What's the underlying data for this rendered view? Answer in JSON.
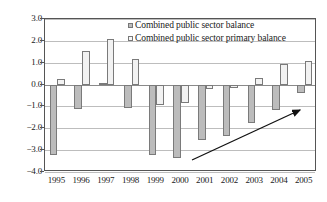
{
  "chart_data": {
    "type": "bar",
    "title": "",
    "xlabel": "",
    "ylabel": "",
    "ylim": [
      -4.0,
      3.0
    ],
    "yticks": [
      "3.0",
      "2.0",
      "1.0",
      "0.0",
      "−1.0",
      "−2.0",
      "−3.0",
      "−4.0"
    ],
    "ytick_values": [
      3.0,
      2.0,
      1.0,
      0.0,
      -1.0,
      -2.0,
      -3.0,
      -4.0
    ],
    "grid": true,
    "legend_position": "top-center",
    "categories": [
      "1995",
      "1996",
      "1997",
      "1998",
      "1999",
      "2000",
      "2001",
      "2002",
      "2003",
      "2004",
      "2005"
    ],
    "series": [
      {
        "name": "Combined public sector balance",
        "color": "#bcbcbc",
        "values": [
          -3.2,
          -1.1,
          0.05,
          -1.05,
          -3.2,
          -3.35,
          -2.55,
          -2.35,
          -1.75,
          -1.15,
          -0.4
        ]
      },
      {
        "name": "Combined public sector primary balance",
        "color": "#f2f2f2",
        "values": [
          0.25,
          1.55,
          2.1,
          1.15,
          -0.95,
          -0.85,
          -0.2,
          -0.15,
          0.3,
          0.95,
          1.1
        ]
      }
    ],
    "annotations": [
      {
        "kind": "arrow",
        "label": "upward-trend-arrow",
        "from": [
          192,
          160
        ],
        "to": [
          300,
          110
        ]
      }
    ]
  }
}
